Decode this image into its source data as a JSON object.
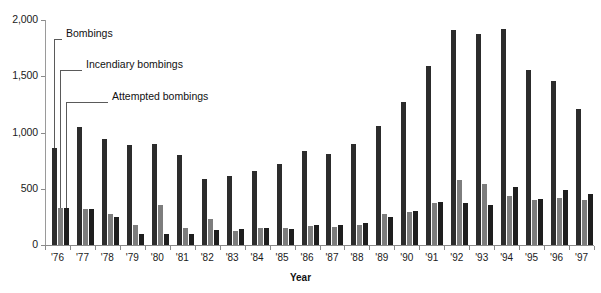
{
  "chart_data": {
    "type": "bar",
    "title": "",
    "xlabel": "Year",
    "ylabel": "",
    "ylim": [
      0,
      2000
    ],
    "yticks": [
      0,
      500,
      1000,
      1500,
      2000
    ],
    "ytick_labels": [
      "0",
      "500",
      "1,000",
      "1,500",
      "2,000"
    ],
    "grid": false,
    "legend_position": "annotated-leader-lines",
    "categories": [
      "'76",
      "'77",
      "'78",
      "'79",
      "'80",
      "'81",
      "'82",
      "'83",
      "'84",
      "'85",
      "'86",
      "'87",
      "'88",
      "'89",
      "'90",
      "'91",
      "'92",
      "'93",
      "'94",
      "'95",
      "'96",
      "'97"
    ],
    "series": [
      {
        "name": "Bombings",
        "color": "#2c2c2c",
        "values": [
          865,
          1050,
          940,
          890,
          900,
          800,
          590,
          610,
          660,
          720,
          840,
          810,
          900,
          1060,
          1270,
          1590,
          1910,
          1880,
          1920,
          1560,
          1460,
          1210
        ]
      },
      {
        "name": "Incendiary bombings",
        "color": "#7d7d7d",
        "values": [
          330,
          320,
          280,
          175,
          360,
          155,
          235,
          125,
          150,
          150,
          165,
          160,
          175,
          280,
          290,
          370,
          580,
          545,
          440,
          400,
          420,
          400
        ]
      },
      {
        "name": "Attempted bombings",
        "color": "#1e1e1e",
        "values": [
          330,
          320,
          250,
          95,
          100,
          100,
          130,
          140,
          155,
          145,
          180,
          180,
          195,
          250,
          300,
          380,
          370,
          360,
          520,
          410,
          490,
          455
        ]
      }
    ],
    "annotations": [
      {
        "label": "Bombings",
        "target_series": 0,
        "target_category": "'76"
      },
      {
        "label": "Incendiary bombings",
        "target_series": 1,
        "target_category": "'76"
      },
      {
        "label": "Attempted bombings",
        "target_series": 2,
        "target_category": "'76"
      }
    ]
  }
}
